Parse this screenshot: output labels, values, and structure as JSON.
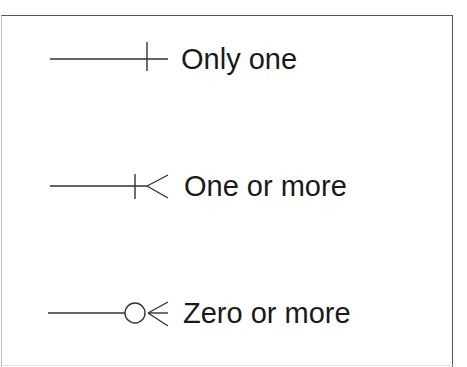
{
  "legend": {
    "items": [
      {
        "symbol": "only-one",
        "label": "Only one"
      },
      {
        "symbol": "one-or-more",
        "label": "One or more"
      },
      {
        "symbol": "zero-or-more",
        "label": "Zero or more"
      }
    ]
  },
  "colors": {
    "stroke": "#333333",
    "border": "#555555",
    "text": "#1a1a1a"
  }
}
